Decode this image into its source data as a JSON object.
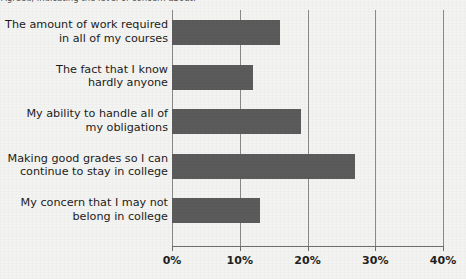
{
  "caption": {
    "text": "Agreed, indicating the level of concern about:"
  },
  "chart_data": {
    "type": "bar",
    "orientation": "horizontal",
    "title": "",
    "xlabel": "",
    "ylabel": "",
    "categories": [
      "The amount of work required in all of my courses",
      "The fact that I know hardly anyone",
      "My ability to handle all of my obligations",
      "Making good grades so I can continue to stay in college",
      "My concern that I may not belong in college"
    ],
    "category_lines": [
      [
        "The amount of work required",
        "in all of my courses"
      ],
      [
        "The fact that I know",
        "hardly anyone"
      ],
      [
        "My ability to handle all of",
        "my obligations"
      ],
      [
        "Making good grades so I can",
        "continue to stay in college"
      ],
      [
        "My concern that I may not",
        "belong in college"
      ]
    ],
    "values": [
      16,
      12,
      19,
      27,
      13
    ],
    "value_unit": "%",
    "xlim": [
      0,
      40
    ],
    "xticks": [
      0,
      10,
      20,
      30,
      40
    ],
    "xticklabels": [
      "0%",
      "10%",
      "20%",
      "30%",
      "40%"
    ],
    "grid": true,
    "grid_axis": "x",
    "legend": false,
    "bar_color": "#5b5b5b",
    "background_color": "#f3f3f1",
    "gridline_color": "#8a8a8a",
    "axis_color": "#6e6e6e"
  }
}
